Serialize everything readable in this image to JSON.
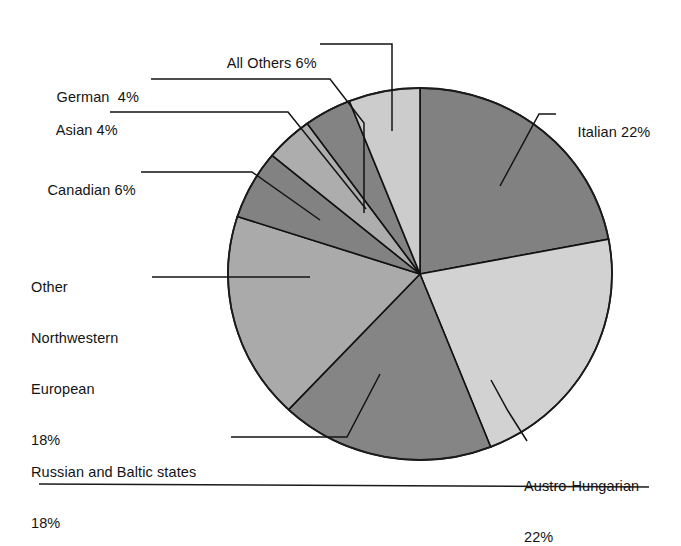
{
  "figure": {
    "background_color": "#ffffff",
    "text_color": "#141414",
    "rule_color": "#1a1a1a"
  },
  "chart_data": {
    "type": "pie",
    "title": "",
    "subtitle": "",
    "xlabel": "",
    "ylabel": "",
    "units": "percent",
    "start_angle_deg": 0,
    "direction": "clockwise",
    "total": 100,
    "legend_position": "callout-labels",
    "grid": false,
    "categories": [
      "Italian",
      "Austro-Hungarian",
      "Russian and Baltic states",
      "Other Northwestern European",
      "Canadian",
      "Asian",
      "German",
      "All Others"
    ],
    "values": [
      22,
      22,
      18,
      18,
      6,
      4,
      4,
      6
    ],
    "slices": [
      {
        "label": "Italian",
        "value": 22,
        "value_text": "22%",
        "color": "#818181"
      },
      {
        "label": "Austro-Hungarian",
        "value": 22,
        "value_text": "22%",
        "color": "#d2d2d2"
      },
      {
        "label": "Russian and Baltic states",
        "value": 18,
        "value_text": "18%",
        "color": "#858585"
      },
      {
        "label": "Other Northwestern European",
        "value": 18,
        "value_text": "18%",
        "color": "#aaaaaa"
      },
      {
        "label": "Canadian",
        "value": 6,
        "value_text": "6%",
        "color": "#828282"
      },
      {
        "label": "Asian",
        "value": 4,
        "value_text": "4%",
        "color": "#adadad"
      },
      {
        "label": "German",
        "value": 4,
        "value_text": "4%",
        "color": "#838383"
      },
      {
        "label": "All Others",
        "value": 6,
        "value_text": "6%",
        "color": "#cccccc"
      }
    ]
  },
  "labels": {
    "all_others": "All Others 6%",
    "german": "German  4%",
    "asian": "Asian 4%",
    "canadian": "Canadian 6%",
    "other_northwestern_line1": "Other",
    "other_northwestern_line2": "Northwestern",
    "other_northwestern_line3": "European",
    "other_northwestern_line4": "18%",
    "russian_line1": "Russian and Baltic states",
    "russian_line2": "18%",
    "italian": "Italian 22%",
    "austro_line1": "Austro-Hungarian",
    "austro_line2": "22%"
  }
}
